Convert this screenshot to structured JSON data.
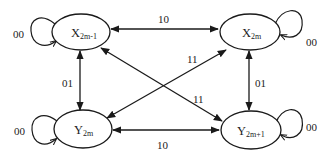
{
  "diagram": {
    "type": "state-transition",
    "nodes": [
      {
        "id": "x2m-1",
        "main": "X",
        "sub": "2m-1",
        "self_loop_label": "00"
      },
      {
        "id": "x2m",
        "main": "X",
        "sub": "2m",
        "self_loop_label": "00"
      },
      {
        "id": "y2m",
        "main": "Y",
        "sub": "2m",
        "self_loop_label": "00"
      },
      {
        "id": "y2m+1",
        "main": "Y",
        "sub": "2m+1",
        "self_loop_label": "00"
      }
    ],
    "edges": [
      {
        "from": "x2m-1",
        "to": "x2m",
        "label": "10",
        "bidirectional": true
      },
      {
        "from": "y2m",
        "to": "y2m+1",
        "label": "10",
        "bidirectional": true
      },
      {
        "from": "x2m-1",
        "to": "y2m",
        "label": "01",
        "bidirectional": true
      },
      {
        "from": "x2m",
        "to": "y2m+1",
        "label": "01",
        "bidirectional": true
      },
      {
        "from": "x2m",
        "to": "y2m",
        "label": "11",
        "bidirectional": true
      },
      {
        "from": "x2m-1",
        "to": "y2m+1",
        "label": "11",
        "bidirectional": true
      }
    ],
    "colors": {
      "stroke": "#1a1a1a",
      "text": "#222222",
      "background": "#ffffff"
    }
  }
}
